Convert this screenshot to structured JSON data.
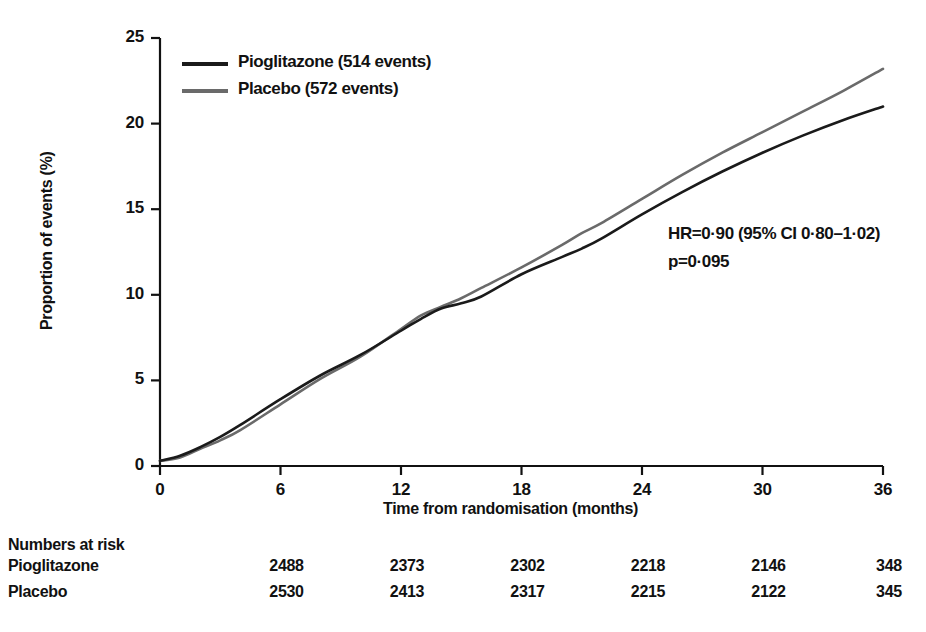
{
  "chart_data": {
    "type": "line",
    "title": "",
    "xlabel": "Time from randomisation (months)",
    "ylabel": "Proportion of events (%)",
    "xlim": [
      0,
      36
    ],
    "ylim": [
      0,
      25
    ],
    "xticks": [
      0,
      6,
      12,
      18,
      24,
      30,
      36
    ],
    "yticks": [
      0,
      5,
      10,
      15,
      20,
      25
    ],
    "grid": false,
    "legend_position": "top-left",
    "series": [
      {
        "name": "Pioglitazone (514 events)",
        "short_name": "Pioglitazone",
        "events": 514,
        "color": "#1a1a1a",
        "x": [
          0,
          1,
          2,
          3,
          4,
          6,
          8,
          10,
          12,
          13,
          14,
          15,
          16,
          18,
          20,
          21,
          22,
          24,
          26,
          28,
          30,
          32,
          34,
          36
        ],
        "y": [
          0.3,
          0.6,
          1.1,
          1.7,
          2.4,
          3.9,
          5.3,
          6.5,
          7.9,
          8.6,
          9.2,
          9.5,
          9.9,
          11.2,
          12.2,
          12.7,
          13.3,
          14.7,
          16.0,
          17.2,
          18.3,
          19.3,
          20.2,
          21.0
        ]
      },
      {
        "name": "Placebo (572 events)",
        "short_name": "Placebo",
        "events": 572,
        "color": "#6a6a6a",
        "x": [
          0,
          1,
          2,
          3,
          4,
          6,
          8,
          10,
          12,
          13,
          14,
          15,
          16,
          18,
          20,
          21,
          22,
          24,
          26,
          28,
          30,
          32,
          34,
          36
        ],
        "y": [
          0.3,
          0.5,
          1.0,
          1.5,
          2.1,
          3.6,
          5.1,
          6.4,
          8.0,
          8.8,
          9.3,
          9.8,
          10.4,
          11.6,
          12.9,
          13.6,
          14.2,
          15.6,
          17.0,
          18.3,
          19.5,
          20.7,
          21.9,
          23.2
        ]
      }
    ],
    "annotations": [
      "HR=0·90 (95% CI 0·80–1·02)",
      "p=0·095"
    ]
  },
  "legend": {
    "entries": [
      {
        "label": "Pioglitazone (514 events)",
        "color": "#1a1a1a"
      },
      {
        "label": "Placebo (572 events)",
        "color": "#6a6a6a"
      }
    ]
  },
  "axes": {
    "y_title": "Proportion of events (%)",
    "x_title": "Time from randomisation (months)",
    "y_ticks": [
      "0",
      "5",
      "10",
      "15",
      "20",
      "25"
    ],
    "x_ticks": [
      "0",
      "6",
      "12",
      "18",
      "24",
      "30",
      "36"
    ]
  },
  "statistics": {
    "hazard_ratio": "HR=0·90 (95% CI 0·80–1·02)",
    "p_value": "p=0·095"
  },
  "risk_table": {
    "heading": "Numbers at risk",
    "timepoints": [
      6,
      12,
      18,
      24,
      30,
      36
    ],
    "rows": [
      {
        "label": "Pioglitazone",
        "values": [
          "2488",
          "2373",
          "2302",
          "2218",
          "2146",
          "348"
        ]
      },
      {
        "label": "Placebo",
        "values": [
          "2530",
          "2413",
          "2317",
          "2215",
          "2122",
          "345"
        ]
      }
    ]
  }
}
